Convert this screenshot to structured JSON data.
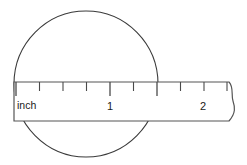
{
  "figure": {
    "background_color": "#ffffff",
    "line_color": "#3a3a3a",
    "ruler_outline_color": "#555555",
    "text_color": "#1a1a1a"
  },
  "circle": {
    "name": "measured-circle",
    "center_x": 86,
    "center_y": 84,
    "radius_x": 72,
    "radius_y": 73
  },
  "ruler": {
    "name": "inch-ruler",
    "left": 14,
    "right": 236,
    "top": 82,
    "bottom": 121,
    "unit_label": "inch",
    "unit_label_x": 17,
    "unit_label_y": 109,
    "torn_end": true,
    "major_labels": [
      {
        "text": "1",
        "x": 110,
        "y": 110
      },
      {
        "text": "2",
        "x": 203,
        "y": 110
      }
    ],
    "ticks": [
      {
        "x": 16,
        "length": 14,
        "major": true,
        "label": "0"
      },
      {
        "x": 39.5,
        "length": 9,
        "major": false,
        "label": "0.25"
      },
      {
        "x": 63,
        "length": 9,
        "major": false,
        "label": "0.5"
      },
      {
        "x": 86.5,
        "length": 9,
        "major": false,
        "label": "0.75"
      },
      {
        "x": 110,
        "length": 14,
        "major": true,
        "label": "1"
      },
      {
        "x": 133.5,
        "length": 9,
        "major": false,
        "label": "1.25"
      },
      {
        "x": 157,
        "length": 14,
        "major": true,
        "label": "1.5"
      },
      {
        "x": 180.5,
        "length": 9,
        "major": false,
        "label": "1.75"
      },
      {
        "x": 204,
        "length": 9,
        "major": false,
        "label": "2"
      },
      {
        "x": 227,
        "length": 9,
        "major": false,
        "label": "2.25"
      }
    ]
  }
}
